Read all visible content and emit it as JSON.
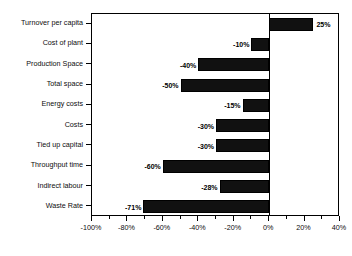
{
  "chart_data": {
    "type": "bar",
    "orientation": "horizontal",
    "title": "",
    "subtitle": "",
    "xlabel": "",
    "ylabel": "",
    "categories": [
      "Turnover per capita",
      "Cost of plant",
      "Production Space",
      "Total space",
      "Energy costs",
      "Costs",
      "Tied up capital",
      "Throughput time",
      "Indirect labour",
      "Waste Rate"
    ],
    "values": [
      25,
      -10,
      -40,
      -50,
      -15,
      -30,
      -30,
      -60,
      -28,
      -71
    ],
    "value_labels": [
      "25%",
      "-10%",
      "-40%",
      "-50%",
      "-15%",
      "-30%",
      "-30%",
      "-60%",
      "-28%",
      "-71%"
    ],
    "xlim": [
      -100,
      40
    ],
    "xticks": [
      -100,
      -80,
      -60,
      -40,
      -20,
      0,
      20,
      40
    ],
    "xtick_labels": [
      "-100%",
      "-80%",
      "-60%",
      "-40%",
      "-20%",
      "0%",
      "20%",
      "40%"
    ],
    "xminor_step": 10,
    "grid": false,
    "legend": null,
    "bar_color": "#111111",
    "axis_color": "#000000",
    "zero_reference": 0
  }
}
